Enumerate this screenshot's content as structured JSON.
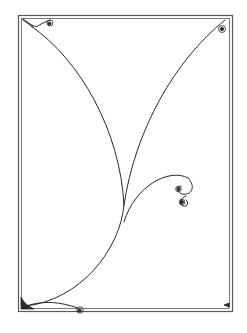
{
  "illustration": {
    "title": "",
    "description": "Decorative line-art frame with curved tendrils and spiral flourishes",
    "colors": {
      "background": "#ffffff",
      "ink": "#2a2a2a",
      "frame": "#555555"
    }
  }
}
